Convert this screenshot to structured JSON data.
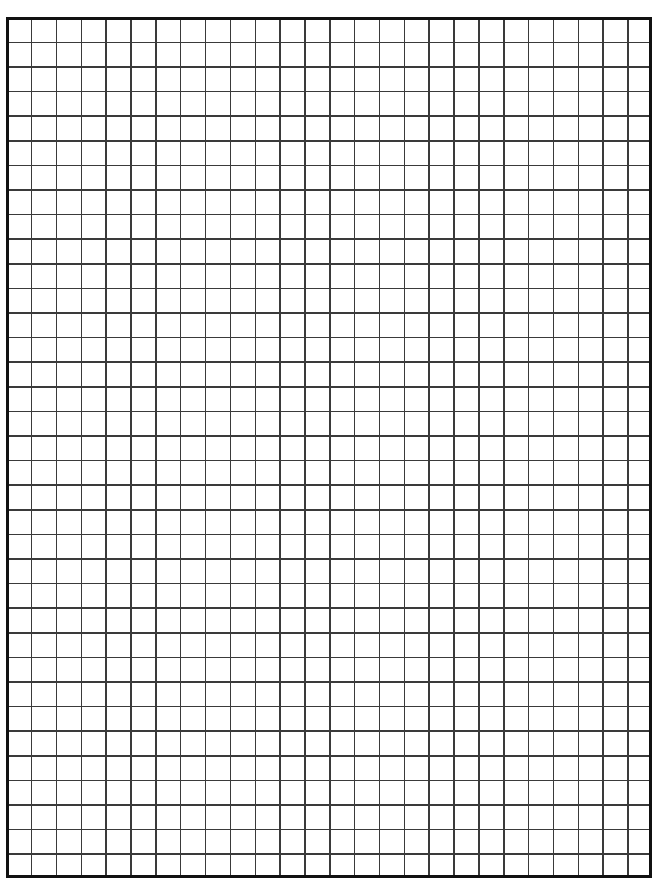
{
  "document": {
    "kind": "graph-paper",
    "title": "Graph Paper",
    "description": "Blank square-ruled graph paper sheet",
    "page": {
      "width_px": 661,
      "height_px": 887,
      "background_color": "#ffffff"
    },
    "grid": {
      "columns": 26,
      "rows": 35,
      "cell_width_px": 24.85,
      "cell_height_px": 24.6,
      "origin_x_px": 6,
      "origin_y_px": 17,
      "grid_width_px": 646,
      "grid_height_px": 861,
      "line_color": "#3a3a3a",
      "line_width_px": 1.5,
      "border_color": "#111111",
      "border_width_px": 3,
      "fill_color": "#ffffff"
    },
    "labels": {
      "empty_sheet_note": ""
    }
  },
  "chart_data": {
    "type": "table",
    "title": "Graph Paper",
    "xlabel": "",
    "ylabel": "",
    "categories": [],
    "values": [],
    "grid": true,
    "legend": "none",
    "columns": 26,
    "rows": 35
  }
}
